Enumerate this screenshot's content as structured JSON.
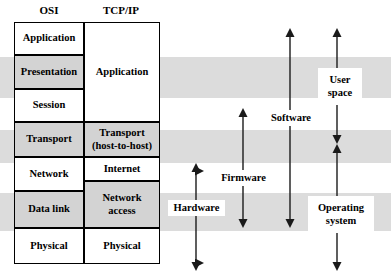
{
  "diagram": {
    "title_osi": "OSI",
    "title_tcpip": "TCP/IP",
    "osi_layers": [
      {
        "label": "Application",
        "shaded": false
      },
      {
        "label": "Presentation",
        "shaded": true
      },
      {
        "label": "Session",
        "shaded": false
      },
      {
        "label": "Transport",
        "shaded": true
      },
      {
        "label": "Network",
        "shaded": false
      },
      {
        "label": "Data link",
        "shaded": true
      },
      {
        "label": "Physical",
        "shaded": false
      }
    ],
    "tcpip_layers": [
      {
        "label": "Application",
        "shaded": false
      },
      {
        "label": "Transport\n(host-to-host)",
        "shaded": true
      },
      {
        "label": "Internet",
        "shaded": false
      },
      {
        "label": "Network\naccess",
        "shaded": true
      },
      {
        "label": "Physical",
        "shaded": false
      }
    ],
    "tcpip_line1": "Transport",
    "tcpip_line2": "(host-to-host)",
    "tcpip_net1": "Network",
    "tcpip_net2": "access",
    "span_labels": [
      {
        "name": "hardware",
        "label": "Hardware"
      },
      {
        "name": "firmware",
        "label": "Firmware"
      },
      {
        "name": "software",
        "label": "Software"
      },
      {
        "name": "user-space",
        "label": "User\nspace",
        "line1": "User",
        "line2": "space"
      },
      {
        "name": "operating-system",
        "label": "Operating\nsystem",
        "line1": "Operating",
        "line2": "system"
      }
    ],
    "colors": {
      "band_shade": "#dcdcdc",
      "cell_shade": "#d3d3d3",
      "stroke": "#000000",
      "background": "#ffffff"
    }
  }
}
